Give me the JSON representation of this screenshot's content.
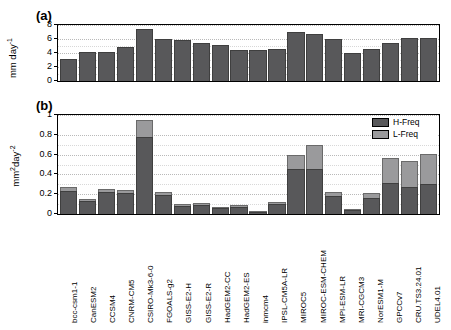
{
  "figure": {
    "panel_a_label": "(a)",
    "panel_b_label": "(b)"
  },
  "colors": {
    "h_freq": "#58585a",
    "l_freq": "#9a9a9c",
    "axis": "#000000",
    "grid": "#b9b9b9",
    "background": "#ffffff"
  },
  "legend": {
    "position": "top-right",
    "items": [
      {
        "label": "H-Freq",
        "color": "#58585a"
      },
      {
        "label": "L-Freq",
        "color": "#9a9a9c"
      }
    ]
  },
  "chart_data": [
    {
      "type": "bar",
      "panel": "(a)",
      "title": "",
      "xlabel": "",
      "ylabel": "mm day-1",
      "ylabel_html": "mm day<sup>-1</sup>",
      "ylim": [
        0,
        8
      ],
      "yticks": [
        0,
        2,
        4,
        6,
        8
      ],
      "ytick_labels": [
        "0",
        "2",
        "4",
        "6",
        "8"
      ],
      "grid": true,
      "categories": [
        "bcc-csm1-1",
        "CanESM2",
        "CCSM4",
        "CNRM-CM5",
        "CSIRO-Mk3-6-0",
        "FGOALS-g2",
        "GISS-E2-H",
        "GISS-E2-R",
        "HadGEM2-CC",
        "HadGEM2-ES",
        "inmcm4",
        "IPSL-CM5A-LR",
        "MIROC5",
        "MIROC-ESM-CHEM",
        "MPI-ESM-LR",
        "MRI-CGCM3",
        "NorESM1-M",
        "GPCCv7",
        "CRU.TS3.24.01",
        "UDEL4.01"
      ],
      "values": [
        3.1,
        4.2,
        4.1,
        4.8,
        7.4,
        6.0,
        5.8,
        5.4,
        5.2,
        4.5,
        4.4,
        4.6,
        7.0,
        6.7,
        6.0,
        4.0,
        4.6,
        5.5,
        6.2,
        6.2
      ]
    },
    {
      "type": "bar",
      "panel": "(b)",
      "stacked": true,
      "title": "",
      "xlabel": "",
      "ylabel": "mm2day-2",
      "ylabel_html": "mm<sup>2</sup>day<sup>-2</sup>",
      "ylim": [
        0,
        1
      ],
      "yticks": [
        0,
        0.2,
        0.4,
        0.6,
        0.8,
        1
      ],
      "ytick_labels": [
        "0",
        "0.2",
        "0.4",
        "0.6",
        "0.8",
        "1"
      ],
      "grid": true,
      "categories": [
        "bcc-csm1-1",
        "CanESM2",
        "CCSM4",
        "CNRM-CM5",
        "CSIRO-Mk3-6-0",
        "FGOALS-g2",
        "GISS-E2-H",
        "GISS-E2-R",
        "HadGEM2-CC",
        "HadGEM2-ES",
        "inmcm4",
        "IPSL-CM5A-LR",
        "MIROC5",
        "MIROC-ESM-CHEM",
        "MPI-ESM-LR",
        "MRI-CGCM3",
        "NorESM1-M",
        "GPCCv7",
        "CRU.TS3.24.01",
        "UDEL4.01"
      ],
      "series": [
        {
          "name": "H-Freq",
          "color": "#58585a",
          "values": [
            0.235,
            0.135,
            0.225,
            0.215,
            0.775,
            0.195,
            0.085,
            0.095,
            0.065,
            0.075,
            0.02,
            0.105,
            0.455,
            0.455,
            0.185,
            0.04,
            0.165,
            0.31,
            0.27,
            0.3
          ]
        },
        {
          "name": "L-Freq",
          "color": "#9a9a9c",
          "values": [
            0.035,
            0.015,
            0.03,
            0.025,
            0.175,
            0.03,
            0.015,
            0.015,
            0.01,
            0.015,
            0.005,
            0.02,
            0.145,
            0.24,
            0.035,
            0.005,
            0.045,
            0.26,
            0.27,
            0.31
          ]
        }
      ],
      "totals": [
        0.27,
        0.15,
        0.255,
        0.24,
        0.95,
        0.225,
        0.1,
        0.11,
        0.075,
        0.09,
        0.025,
        0.125,
        0.6,
        0.695,
        0.22,
        0.045,
        0.21,
        0.57,
        0.54,
        0.61
      ]
    }
  ]
}
